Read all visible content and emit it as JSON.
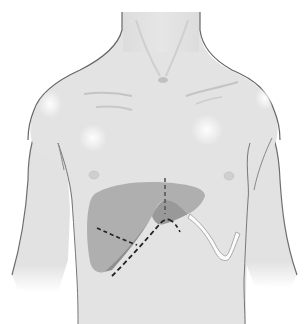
{
  "figure": {
    "colors": {
      "background": "#ffffff",
      "skin": "#e4e4e4",
      "skin_shadow": "#d2d2d2",
      "outline": "#6e6e6e",
      "liver": "#a8a8a8",
      "liver_dark": "#8f8f8f",
      "incision": "#333333",
      "highlight": "#fafafa"
    },
    "elements": [
      {
        "name": "neck"
      },
      {
        "name": "torso"
      },
      {
        "name": "left-arm"
      },
      {
        "name": "right-arm"
      },
      {
        "name": "suprasternal-notch"
      },
      {
        "name": "left-clavicle"
      },
      {
        "name": "right-clavicle"
      },
      {
        "name": "left-nipple"
      },
      {
        "name": "right-nipple"
      },
      {
        "name": "liver"
      },
      {
        "name": "midline-incision"
      },
      {
        "name": "right-subcostal-incision"
      },
      {
        "name": "left-subcostal-incision"
      },
      {
        "name": "oblique-incision"
      }
    ]
  }
}
